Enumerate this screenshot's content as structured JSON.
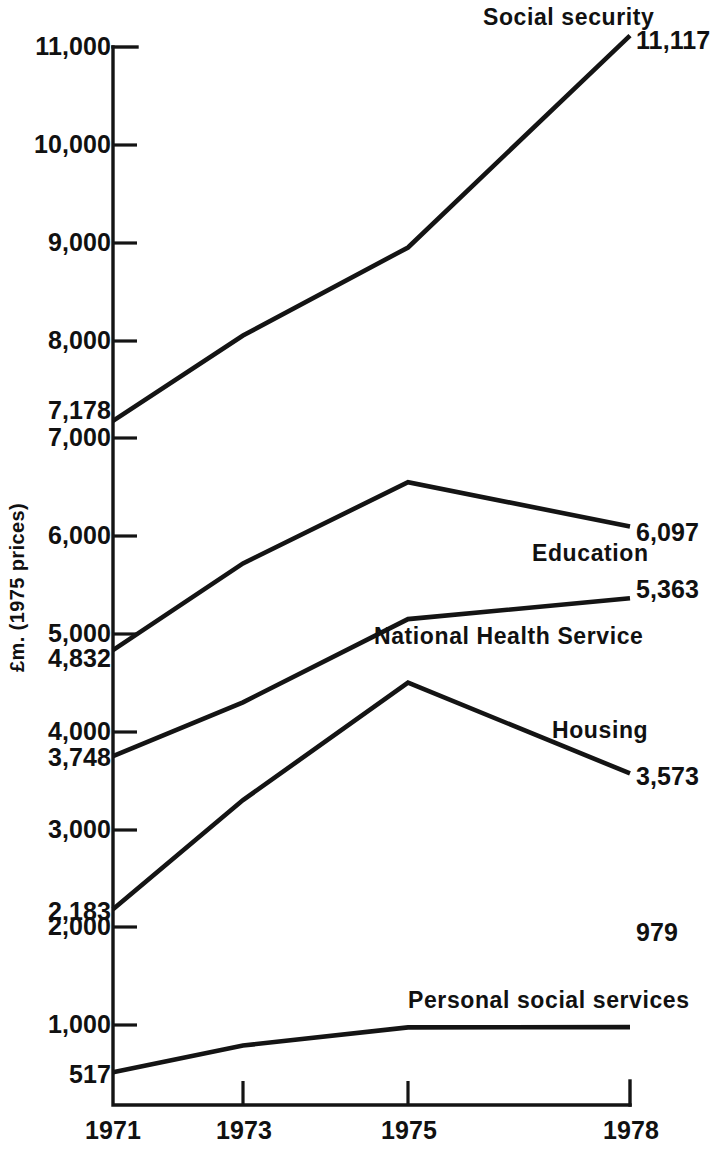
{
  "axis": {
    "y_title": "£m. (1975 prices)",
    "y_ticks": [
      "11,000",
      "10,000",
      "9,000",
      "8,000",
      "7,000",
      "6,000",
      "5,000",
      "4,000",
      "3,000",
      "2,000",
      "1,000"
    ],
    "x_ticks": [
      "1971",
      "1973",
      "1975",
      "1978"
    ],
    "start_value_labels": [
      "7,178",
      "4,832",
      "3,748",
      "2,183",
      "517"
    ],
    "end_value_labels": [
      "11,117",
      "6,097",
      "5,363",
      "3,573",
      "979"
    ]
  },
  "series_labels": {
    "social_security": "Social security",
    "education": "Education",
    "nhs": "National Health Service",
    "housing": "Housing",
    "pss": "Personal social services"
  },
  "chart_data": {
    "type": "line",
    "title": "",
    "xlabel": "",
    "ylabel": "£m. (1975 prices)",
    "x": [
      1971,
      1973,
      1975,
      1978
    ],
    "categories": [
      "1971",
      "1973",
      "1975",
      "1978"
    ],
    "ylim": [
      0,
      11000
    ],
    "xlim": [
      1971,
      1978
    ],
    "grid": false,
    "legend": "inline-annotations",
    "line_color": "#141414",
    "series": [
      {
        "name": "Social security",
        "values": [
          7178,
          8050,
          8950,
          11117
        ],
        "start_label": "7,178",
        "end_label": "11,117"
      },
      {
        "name": "Education",
        "values": [
          4832,
          5720,
          6550,
          6097
        ],
        "start_label": "4,832",
        "end_label": "6,097"
      },
      {
        "name": "National Health Service",
        "values": [
          3748,
          4300,
          5150,
          5363
        ],
        "start_label": "3,748",
        "end_label": "5,363"
      },
      {
        "name": "Housing",
        "values": [
          2183,
          3300,
          4500,
          3573
        ],
        "start_label": "2,183",
        "end_label": "3,573"
      },
      {
        "name": "Personal social services",
        "values": [
          517,
          790,
          975,
          979
        ],
        "start_label": "517",
        "end_label": "979"
      }
    ]
  }
}
